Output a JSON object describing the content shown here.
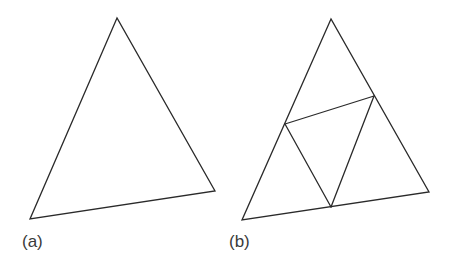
{
  "figure": {
    "panels": [
      {
        "label": "(a)",
        "description": "Single triangle",
        "vertices": [
          [
            117,
            18
          ],
          [
            30,
            219
          ],
          [
            215,
            191
          ]
        ],
        "inner_edges": []
      },
      {
        "label": "(b)",
        "description": "Triangle subdivided into four triangles by connecting edge midpoints",
        "vertices": [
          [
            331,
            19
          ],
          [
            242,
            220
          ],
          [
            429,
            192
          ]
        ],
        "midpoints": [
          [
            285,
            124
          ],
          [
            374,
            96
          ],
          [
            331,
            207
          ]
        ],
        "inner_edges": [
          [
            [
              285,
              124
            ],
            [
              374,
              96
            ]
          ],
          [
            [
              285,
              124
            ],
            [
              331,
              207
            ]
          ],
          [
            [
              374,
              96
            ],
            [
              331,
              207
            ]
          ]
        ]
      }
    ],
    "line_color": "#2a2a2a",
    "background": "#ffffff"
  }
}
